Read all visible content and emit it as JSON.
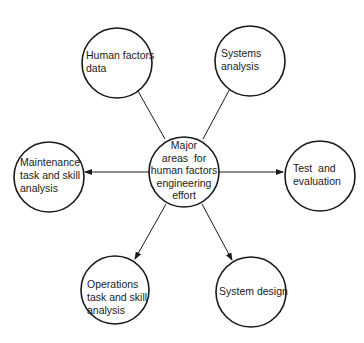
{
  "diagram": {
    "center": {
      "id": "center",
      "lines": [
        "Major",
        "areas  for",
        "human factors",
        "engineering",
        "effort"
      ],
      "cx": 184,
      "cy": 172,
      "r": 35
    },
    "nodes": [
      {
        "id": "human-factors-data",
        "lines": [
          "Human factors",
          "data"
        ],
        "cx": 117,
        "cy": 63,
        "r": 35,
        "label_x": 86,
        "label_y": 49
      },
      {
        "id": "systems-analysis",
        "lines": [
          "Systems",
          "analysis"
        ],
        "cx": 250,
        "cy": 61,
        "r": 35,
        "label_x": 221,
        "label_y": 47
      },
      {
        "id": "maintenance-task-skill-analysis",
        "lines": [
          "Maintenance",
          "task and skill",
          "analysis"
        ],
        "cx": 49,
        "cy": 177,
        "r": 35,
        "label_x": 20,
        "label_y": 156
      },
      {
        "id": "test-and-evaluation",
        "lines": [
          "Test  and",
          "evaluation"
        ],
        "cx": 320,
        "cy": 176,
        "r": 35,
        "label_x": 293,
        "label_y": 162
      },
      {
        "id": "operations-task-skill-analysis",
        "lines": [
          "Operations",
          "task and skill",
          "analysis"
        ],
        "cx": 115,
        "cy": 290,
        "r": 34,
        "label_x": 87,
        "label_y": 278
      },
      {
        "id": "system-design",
        "lines": [
          "System design"
        ],
        "cx": 251,
        "cy": 292,
        "r": 35,
        "label_x": 219,
        "label_y": 285
      }
    ],
    "edges": [
      {
        "from": "center",
        "to": "human-factors-data",
        "x1": 165,
        "y1": 139,
        "x2": 134,
        "y2": 84
      },
      {
        "from": "center",
        "to": "systems-analysis",
        "x1": 203,
        "y1": 139,
        "x2": 233,
        "y2": 83
      },
      {
        "from": "center",
        "to": "maintenance-task-skill-analysis",
        "x1": 149,
        "y1": 172,
        "x2": 85,
        "y2": 172
      },
      {
        "from": "center",
        "to": "test-and-evaluation",
        "x1": 219,
        "y1": 172,
        "x2": 283,
        "y2": 172
      },
      {
        "from": "center",
        "to": "operations-task-skill-analysis",
        "x1": 166,
        "y1": 204,
        "x2": 135,
        "y2": 259
      },
      {
        "from": "center",
        "to": "system-design",
        "x1": 202,
        "y1": 204,
        "x2": 232,
        "y2": 260
      }
    ],
    "colors": {
      "stroke": "#1a1a1a",
      "background": "#ffffff"
    }
  }
}
